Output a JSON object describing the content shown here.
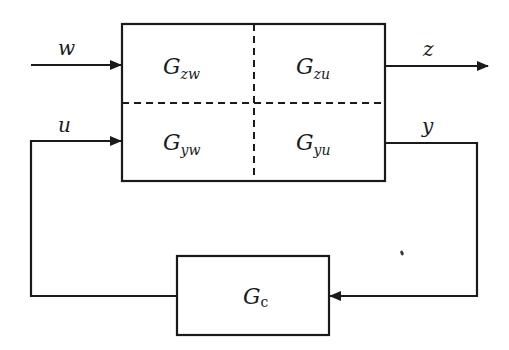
{
  "diagram": {
    "type": "block-diagram",
    "plant": {
      "blocks": [
        {
          "main": "G",
          "sub": "zw",
          "position": "top-left"
        },
        {
          "main": "G",
          "sub": "zu",
          "position": "top-right"
        },
        {
          "main": "G",
          "sub": "yw",
          "position": "bottom-left"
        },
        {
          "main": "G",
          "sub": "yu",
          "position": "bottom-right"
        }
      ]
    },
    "controller": {
      "main": "G",
      "sub": "c"
    },
    "signals": {
      "w": "w",
      "u": "u",
      "z": "z",
      "y": "y"
    },
    "colors": {
      "stroke": "#1a1a1a",
      "background": "#ffffff"
    }
  }
}
